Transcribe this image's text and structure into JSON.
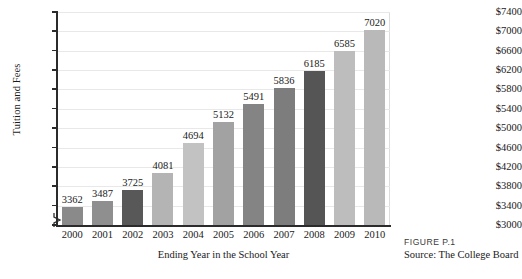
{
  "chart_data": {
    "type": "bar",
    "title": "",
    "xlabel": "Ending Year in the School Year",
    "ylabel": "Tuition and Fees",
    "categories": [
      "2000",
      "2001",
      "2002",
      "2003",
      "2004",
      "2005",
      "2006",
      "2007",
      "2008",
      "2009",
      "2010"
    ],
    "values": [
      3362,
      3487,
      3725,
      4081,
      4694,
      5132,
      5491,
      5836,
      6185,
      6585,
      7020
    ],
    "value_labels": [
      "3362",
      "3487",
      "3725",
      "4081",
      "4694",
      "5132",
      "5491",
      "5836",
      "6185",
      "6585",
      "7020"
    ],
    "ylim": [
      3000,
      7400
    ],
    "ytick_labels": [
      "$7400",
      "$7000",
      "$6600",
      "$6200",
      "$5800",
      "$5400",
      "$5000",
      "$4600",
      "$4200",
      "$3800",
      "$3400",
      "$3000"
    ],
    "ytick_values": [
      7400,
      7000,
      6600,
      6200,
      5800,
      5400,
      5000,
      4600,
      4200,
      3800,
      3400,
      3000
    ],
    "grid": true,
    "axis_break": true,
    "legend": "none",
    "bar_colors": [
      "#8a8a8a",
      "#8f8f8f",
      "#585858",
      "#b4b4b4",
      "#c2c2c2",
      "#a2a2a2",
      "#848484",
      "#7d7d7d",
      "#555555",
      "#bdbdbd",
      "#b9b9b9"
    ]
  },
  "caption": {
    "figure_id": "FIGURE P.1",
    "source": "Source: The College Board"
  }
}
